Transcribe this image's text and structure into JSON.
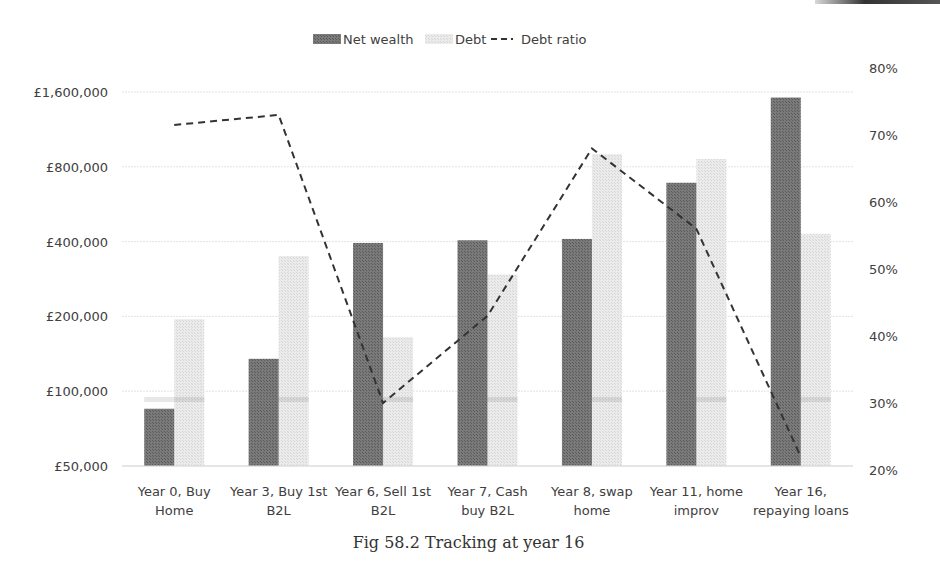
{
  "caption": "Fig 58.2 Tracking at year 16",
  "legend": {
    "items": [
      {
        "label": "Net wealth",
        "type": "bar",
        "color": "#6e6e6e"
      },
      {
        "label": "Debt",
        "type": "bar",
        "color": "#e6e6e6"
      },
      {
        "label": "Debt ratio",
        "type": "dashed-line",
        "color": "#333333"
      }
    ]
  },
  "colors": {
    "net_wealth": "#6e6e6e",
    "debt": "#e4e4e4",
    "debt_ratio": "#333333",
    "gridline": "#e3e3e3"
  },
  "chart_data": {
    "type": "bar",
    "title": "",
    "xlabel": "",
    "ylabel": "",
    "y_scale": "log2",
    "categories": [
      "Year 0, Buy Home",
      "Year 3, Buy 1st B2L",
      "Year 6, Sell 1st B2L",
      "Year 7, Cash buy B2L",
      "Year 8, swap home",
      "Year 11, home improv",
      "Year 16, repaying loans"
    ],
    "category_lines": [
      [
        "Year 0, Buy",
        "Home"
      ],
      [
        "Year 3, Buy 1st",
        "B2L"
      ],
      [
        "Year 6, Sell 1st",
        "B2L"
      ],
      [
        "Year 7, Cash",
        "buy B2L"
      ],
      [
        "Year 8, swap",
        "home"
      ],
      [
        "Year 11, home",
        "improv"
      ],
      [
        "Year 16,",
        "repaying loans"
      ]
    ],
    "series": [
      {
        "name": "Net wealth",
        "type": "bar",
        "axis": "left",
        "values": [
          85000,
          135000,
          395000,
          405000,
          410000,
          690000,
          1520000
        ]
      },
      {
        "name": "Debt",
        "type": "bar",
        "axis": "left",
        "values": [
          195000,
          350000,
          165000,
          295000,
          900000,
          860000,
          430000
        ]
      },
      {
        "name": "Debt ratio",
        "type": "line",
        "style": "dashed",
        "axis": "right",
        "values": [
          0.715,
          0.73,
          0.3,
          0.43,
          0.68,
          0.56,
          0.22
        ]
      }
    ],
    "left_axis": {
      "ticks": [
        50000,
        100000,
        200000,
        400000,
        800000,
        1600000
      ],
      "tick_labels": [
        "£50,000",
        "£100,000",
        "£200,000",
        "£400,000",
        "£800,000",
        "£1,600,000"
      ],
      "ylim": [
        50000,
        1600000
      ]
    },
    "right_axis": {
      "ticks": [
        0.2,
        0.3,
        0.4,
        0.5,
        0.6,
        0.7,
        0.8
      ],
      "tick_labels": [
        "20%",
        "30%",
        "40%",
        "50%",
        "60%",
        "70%",
        "80%"
      ],
      "ylim": [
        0.2,
        0.8
      ]
    },
    "grid": true,
    "legend_position": "top"
  }
}
